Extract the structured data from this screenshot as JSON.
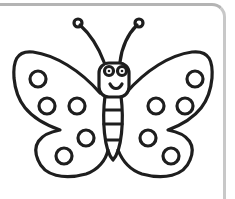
{
  "image": {
    "subject": "butterfly coloring page",
    "colors": {
      "outline": "#1e1e1e",
      "background": "#ffffff",
      "card_border": "#b4b4b4"
    }
  }
}
